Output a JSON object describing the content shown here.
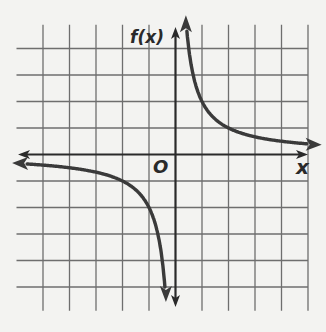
{
  "chart_data": {
    "type": "line",
    "title": "",
    "function": "f(x) = 2/x",
    "xlabel": "x",
    "ylabel": "f(x)",
    "origin_label": "O",
    "xlim": [
      -5.5,
      5.5
    ],
    "ylim": [
      -5.5,
      5.5
    ],
    "grid": true,
    "grid_step": 1,
    "tick_labels": false,
    "asymptotes": {
      "vertical": 0,
      "horizontal": 0
    },
    "series": [
      {
        "name": "branch-quadrant-I",
        "x": [
          0.4,
          0.5,
          1,
          2,
          3,
          4,
          5
        ],
        "y": [
          5,
          4,
          2,
          1,
          0.67,
          0.5,
          0.4
        ]
      },
      {
        "name": "branch-quadrant-III",
        "x": [
          -5.5,
          -5,
          -4,
          -3,
          -2,
          -1,
          -0.5,
          -0.4
        ],
        "y": [
          -0.36,
          -0.4,
          -0.5,
          -0.67,
          -1,
          -2,
          -4,
          -5.4
        ]
      }
    ],
    "colors": {
      "curve": "#3a3a3a",
      "axis": "#2a2a2a",
      "grid": "#6e6e6e",
      "background": "#f3f3f1"
    }
  }
}
